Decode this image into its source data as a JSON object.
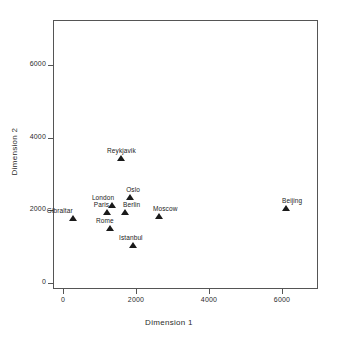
{
  "chart_data": {
    "type": "scatter",
    "title": "",
    "xlabel": "Dimension 1",
    "ylabel": "Dimension 2",
    "xlim": [
      -300,
      7000
    ],
    "ylim": [
      -250,
      7200
    ],
    "xticks": [
      "0",
      "2000",
      "4000",
      "6000"
    ],
    "xtick_values": [
      0,
      2000,
      4000,
      6000
    ],
    "yticks": [
      "0",
      "2000",
      "4000",
      "6000"
    ],
    "ytick_values": [
      0,
      2000,
      4000,
      6000
    ],
    "grid": false,
    "legend": false,
    "marker": "filled-triangle",
    "marker_color": "#1a1a1a",
    "points": [
      {
        "label": "Gibraltar",
        "x": 270,
        "y": 1790,
        "label_dx": -26,
        "label_dy": -11
      },
      {
        "label": "London",
        "x": 1340,
        "y": 2150,
        "label_dx": -20,
        "label_dy": -11
      },
      {
        "label": "Paris",
        "x": 1200,
        "y": 1950,
        "label_dx": -13,
        "label_dy": -11
      },
      {
        "label": "Berlin",
        "x": 1700,
        "y": 1950,
        "label_dx": -2,
        "label_dy": -11
      },
      {
        "label": "Rome",
        "x": 1290,
        "y": 1510,
        "label_dx": -14,
        "label_dy": -11
      },
      {
        "label": "Reykjavik",
        "x": 1590,
        "y": 3440,
        "label_dx": -14,
        "label_dy": -11
      },
      {
        "label": "Oslo",
        "x": 1840,
        "y": 2370,
        "label_dx": -4,
        "label_dy": -11
      },
      {
        "label": "Istanbul",
        "x": 1920,
        "y": 1045,
        "label_dx": -14,
        "label_dy": -11
      },
      {
        "label": "Moscow",
        "x": 2630,
        "y": 1840,
        "label_dx": -6,
        "label_dy": -11
      },
      {
        "label": "Beijing",
        "x": 6110,
        "y": 2060,
        "label_dx": -4,
        "label_dy": -11
      }
    ]
  },
  "axes": {
    "x_title": "Dimension 1",
    "y_title": "Dimension 2"
  }
}
